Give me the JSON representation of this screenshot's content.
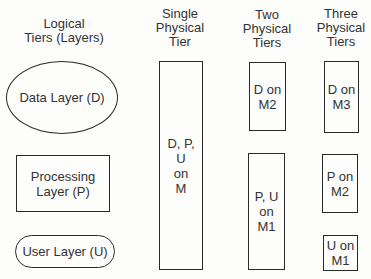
{
  "headers": {
    "logical": "Logical\nTiers (Layers)",
    "single": "Single\nPhysical\nTier",
    "two": "Two\nPhysical\nTiers",
    "three": "Three\nPhysical\nTiers"
  },
  "logical_layers": {
    "data": "Data Layer  (D)",
    "processing": "Processing\nLayer  (P)",
    "user": "User Layer (U)"
  },
  "single_tier": {
    "box": "D, P,\nU\non\nM"
  },
  "two_tiers": {
    "data_box": "D on\nM2",
    "pu_box": "P, U\non\nM1"
  },
  "three_tiers": {
    "data_box": "D on\nM3",
    "processing_box": "P on\nM2",
    "user_box": "U on\nM1"
  }
}
